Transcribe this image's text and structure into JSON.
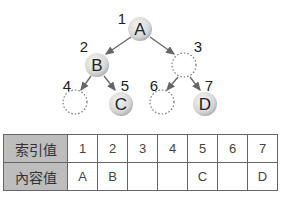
{
  "tree": {
    "nodes": [
      {
        "index": "1",
        "label": "A",
        "present": true
      },
      {
        "index": "2",
        "label": "B",
        "present": true
      },
      {
        "index": "3",
        "label": "",
        "present": false
      },
      {
        "index": "4",
        "label": "",
        "present": false
      },
      {
        "index": "5",
        "label": "C",
        "present": true
      },
      {
        "index": "6",
        "label": "",
        "present": false
      },
      {
        "index": "7",
        "label": "D",
        "present": true
      }
    ]
  },
  "table": {
    "row_headers": [
      "索引值",
      "內容值"
    ],
    "index_row": [
      "1",
      "2",
      "3",
      "4",
      "5",
      "6",
      "7"
    ],
    "content_row": [
      "A",
      "B",
      "",
      "",
      "C",
      "",
      "D"
    ]
  }
}
